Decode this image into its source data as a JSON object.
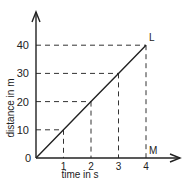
{
  "chart_data": {
    "type": "line",
    "title": "",
    "xlabel": "time in s",
    "ylabel": "distance in m",
    "x": [
      0,
      1,
      2,
      3,
      4
    ],
    "series": [
      {
        "name": "distance",
        "values": [
          0,
          10,
          20,
          30,
          40
        ]
      }
    ],
    "x_ticks": [
      "1",
      "2",
      "3",
      "4"
    ],
    "y_ticks": [
      "0",
      "10",
      "20",
      "30",
      "40"
    ],
    "xlim": [
      0,
      4.9
    ],
    "ylim": [
      0,
      52
    ],
    "grid": false,
    "guide_lines": "dashed projections from each point to both axes",
    "annotations": [
      {
        "label": "L",
        "x": 4,
        "y": 40
      },
      {
        "label": "M",
        "x": 4,
        "y": 0
      }
    ]
  },
  "colors": {
    "line": "#222222",
    "axis": "#222222",
    "background": "#ffffff"
  }
}
